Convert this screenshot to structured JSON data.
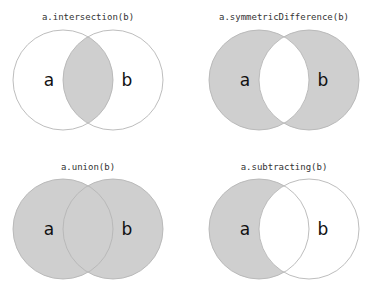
{
  "colors": {
    "fill": "#cfcfcf",
    "stroke": "#b5b5b5",
    "background": "#ffffff",
    "text": "#111111"
  },
  "diagrams": [
    {
      "title": "a.intersection(b)",
      "set_a_label": "a",
      "set_b_label": "b",
      "shaded": "a ∩ b"
    },
    {
      "title": "a.symmetricDifference(b)",
      "set_a_label": "a",
      "set_b_label": "b",
      "shaded": "(a ∪ b) − (a ∩ b)"
    },
    {
      "title": "a.union(b)",
      "set_a_label": "a",
      "set_b_label": "b",
      "shaded": "a ∪ b"
    },
    {
      "title": "a.subtracting(b)",
      "set_a_label": "a",
      "set_b_label": "b",
      "shaded": "a − b"
    }
  ]
}
